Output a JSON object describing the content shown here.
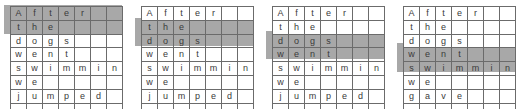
{
  "figure": {
    "kind": "letter-grid-sequence",
    "panel_count": 4,
    "columns": 7,
    "highlight_color": "#a8a8a8",
    "grid_line_color": "#6b6b6b",
    "cell_background": "#ffffff",
    "text_color": "#3a3a3a"
  },
  "panels": [
    {
      "id": "panel-1",
      "rows": [
        {
          "word": "After",
          "letters": [
            "A",
            "f",
            "t",
            "e",
            "r",
            "",
            ""
          ],
          "highlighted": true
        },
        {
          "word": "the",
          "letters": [
            "t",
            "h",
            "e",
            "",
            "",
            "",
            ""
          ],
          "highlighted": true
        },
        {
          "word": "dogs",
          "letters": [
            "d",
            "o",
            "g",
            "s",
            "",
            "",
            ""
          ],
          "highlighted": false
        },
        {
          "word": "went",
          "letters": [
            "w",
            "e",
            "n",
            "t",
            "",
            "",
            ""
          ],
          "highlighted": false
        },
        {
          "word": "swimming",
          "letters": [
            "s",
            "w",
            "i",
            "m",
            "m",
            "i",
            "n"
          ],
          "highlighted": false
        },
        {
          "word": "we",
          "letters": [
            "w",
            "e",
            "",
            "",
            "",
            "",
            ""
          ],
          "highlighted": false
        },
        {
          "word": "jumped",
          "letters": [
            "j",
            "u",
            "m",
            "p",
            "e",
            "d",
            ""
          ],
          "highlighted": false
        },
        {
          "word": "",
          "letters": [
            "",
            "",
            "",
            "",
            "",
            "",
            ""
          ],
          "highlighted": false
        }
      ],
      "highlight_start_row": 1,
      "highlight_row_count": 2
    },
    {
      "id": "panel-2",
      "rows": [
        {
          "word": "After",
          "letters": [
            "A",
            "f",
            "t",
            "e",
            "r",
            "",
            ""
          ],
          "highlighted": false
        },
        {
          "word": "the",
          "letters": [
            "t",
            "h",
            "e",
            "",
            "",
            "",
            ""
          ],
          "highlighted": true
        },
        {
          "word": "dogs",
          "letters": [
            "d",
            "o",
            "g",
            "s",
            "",
            "",
            ""
          ],
          "highlighted": true
        },
        {
          "word": "went",
          "letters": [
            "w",
            "e",
            "n",
            "t",
            "",
            "",
            ""
          ],
          "highlighted": false
        },
        {
          "word": "swimming",
          "letters": [
            "s",
            "w",
            "i",
            "m",
            "m",
            "i",
            "n"
          ],
          "highlighted": false
        },
        {
          "word": "we",
          "letters": [
            "w",
            "e",
            "",
            "",
            "",
            "",
            ""
          ],
          "highlighted": false
        },
        {
          "word": "jumped",
          "letters": [
            "j",
            "u",
            "m",
            "p",
            "e",
            "d",
            ""
          ],
          "highlighted": false
        },
        {
          "word": "",
          "letters": [
            "",
            "",
            "",
            "",
            "",
            "",
            ""
          ],
          "highlighted": false
        }
      ],
      "highlight_start_row": 2,
      "highlight_row_count": 2
    },
    {
      "id": "panel-3",
      "rows": [
        {
          "word": "After",
          "letters": [
            "A",
            "f",
            "t",
            "e",
            "r",
            "",
            ""
          ],
          "highlighted": false
        },
        {
          "word": "the",
          "letters": [
            "t",
            "h",
            "e",
            "",
            "",
            "",
            ""
          ],
          "highlighted": false
        },
        {
          "word": "dogs",
          "letters": [
            "d",
            "o",
            "g",
            "s",
            "",
            "",
            ""
          ],
          "highlighted": true
        },
        {
          "word": "went",
          "letters": [
            "w",
            "e",
            "n",
            "t",
            "",
            "",
            ""
          ],
          "highlighted": true
        },
        {
          "word": "swimming",
          "letters": [
            "s",
            "w",
            "i",
            "m",
            "m",
            "i",
            "n"
          ],
          "highlighted": false
        },
        {
          "word": "we",
          "letters": [
            "w",
            "e",
            "",
            "",
            "",
            "",
            ""
          ],
          "highlighted": false
        },
        {
          "word": "jumped",
          "letters": [
            "j",
            "u",
            "m",
            "p",
            "e",
            "d",
            ""
          ],
          "highlighted": false
        },
        {
          "word": "",
          "letters": [
            "",
            "",
            "",
            "",
            "",
            "",
            ""
          ],
          "highlighted": false
        }
      ],
      "highlight_start_row": 3,
      "highlight_row_count": 2
    },
    {
      "id": "panel-4",
      "rows": [
        {
          "word": "After",
          "letters": [
            "A",
            "f",
            "t",
            "e",
            "r",
            "",
            ""
          ],
          "highlighted": false
        },
        {
          "word": "the",
          "letters": [
            "t",
            "h",
            "e",
            "",
            "",
            "",
            ""
          ],
          "highlighted": false
        },
        {
          "word": "dogs",
          "letters": [
            "d",
            "o",
            "g",
            "s",
            "",
            "",
            ""
          ],
          "highlighted": false
        },
        {
          "word": "went",
          "letters": [
            "w",
            "e",
            "n",
            "t",
            "",
            "",
            ""
          ],
          "highlighted": true
        },
        {
          "word": "swimming",
          "letters": [
            "s",
            "w",
            "i",
            "m",
            "m",
            "i",
            "n"
          ],
          "highlighted": true
        },
        {
          "word": "we",
          "letters": [
            "w",
            "e",
            "",
            "",
            "",
            "",
            ""
          ],
          "highlighted": false
        },
        {
          "word": "gave",
          "letters": [
            "g",
            "a",
            "v",
            "e",
            "",
            "",
            ""
          ],
          "highlighted": false
        },
        {
          "word": "",
          "letters": [
            "",
            "",
            "",
            "",
            "",
            "",
            ""
          ],
          "highlighted": false
        }
      ],
      "highlight_start_row": 4,
      "highlight_row_count": 2
    }
  ]
}
